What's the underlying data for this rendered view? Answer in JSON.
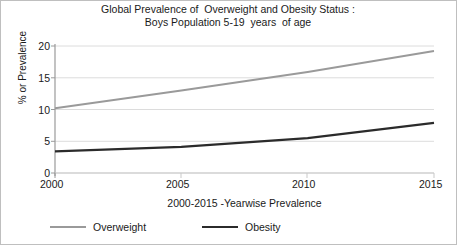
{
  "chart_data": {
    "type": "line",
    "title": "Global Prevalence of  Overweight and Obesity Status :",
    "subtitle": "Boys Population 5-19  years  of age",
    "xlabel": "2000-2015 -Yearwise Prevalence",
    "ylabel": "% or Prevalence",
    "x": [
      2000,
      2005,
      2010,
      2015
    ],
    "xticks": [
      "2000",
      "2005",
      "2010",
      "2015"
    ],
    "yticks": [
      "0",
      "5",
      "10",
      "15",
      "20"
    ],
    "xlim": [
      2000,
      2015
    ],
    "ylim": [
      0,
      20
    ],
    "grid": true,
    "grid_axis": "y",
    "legend_position": "bottom-left",
    "series": [
      {
        "name": "Overweight",
        "color": "#9a9a9a",
        "values": [
          10.2,
          13.0,
          15.9,
          19.2
        ]
      },
      {
        "name": "Obesity",
        "color": "#2b2b2b",
        "values": [
          3.4,
          4.1,
          5.5,
          7.9
        ]
      }
    ]
  },
  "legend": {
    "items": [
      {
        "label": "Overweight",
        "color": "#9a9a9a"
      },
      {
        "label": "Obesity",
        "color": "#2b2b2b"
      }
    ]
  },
  "axis": {
    "y_tick_0": "0",
    "y_tick_1": "5",
    "y_tick_2": "10",
    "y_tick_3": "15",
    "y_tick_4": "20",
    "x_tick_0": "2000",
    "x_tick_1": "2005",
    "x_tick_2": "2010",
    "x_tick_3": "2015"
  },
  "colors": {
    "overweight": "#9a9a9a",
    "obesity": "#2b2b2b",
    "grid": "#d9d9d9",
    "axis": "#9a9a9a",
    "text": "#1a1a1a",
    "border": "#bfbfbf"
  }
}
